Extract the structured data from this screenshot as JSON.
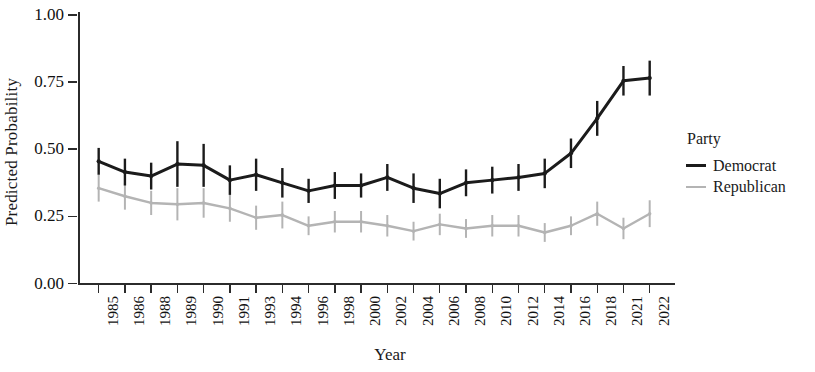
{
  "chart_data": {
    "type": "line",
    "title": "",
    "xlabel": "Year",
    "ylabel": "Predicted Probability",
    "ylim": [
      0.0,
      1.0
    ],
    "yticks": [
      "0.00",
      "0.25",
      "0.50",
      "0.75",
      "1.00"
    ],
    "ytick_values": [
      0.0,
      0.25,
      0.5,
      0.75,
      1.0
    ],
    "grid": false,
    "legend_position": "right",
    "legend_title": "Party",
    "error_bars": "vertical confidence intervals",
    "categories": [
      "1985",
      "1986",
      "1988",
      "1989",
      "1990",
      "1991",
      "1993",
      "1994",
      "1996",
      "1998",
      "2000",
      "2002",
      "2004",
      "2006",
      "2008",
      "2010",
      "2012",
      "2014",
      "2016",
      "2018",
      "2021",
      "2022"
    ],
    "series": [
      {
        "name": "Democrat",
        "color": "#1b1b1b",
        "values": [
          0.455,
          0.415,
          0.4,
          0.445,
          0.44,
          0.385,
          0.405,
          0.375,
          0.345,
          0.365,
          0.365,
          0.395,
          0.355,
          0.335,
          0.375,
          0.385,
          0.395,
          0.41,
          0.485,
          0.615,
          0.755,
          0.765
        ],
        "ci_low": [
          0.405,
          0.365,
          0.35,
          0.36,
          0.36,
          0.33,
          0.345,
          0.32,
          0.3,
          0.315,
          0.32,
          0.345,
          0.3,
          0.28,
          0.325,
          0.335,
          0.345,
          0.355,
          0.43,
          0.55,
          0.7,
          0.7
        ],
        "ci_high": [
          0.505,
          0.465,
          0.45,
          0.53,
          0.52,
          0.44,
          0.465,
          0.43,
          0.39,
          0.415,
          0.41,
          0.445,
          0.41,
          0.39,
          0.425,
          0.435,
          0.445,
          0.465,
          0.54,
          0.68,
          0.81,
          0.83
        ]
      },
      {
        "name": "Republican",
        "color": "#b4b4b4",
        "values": [
          0.355,
          0.325,
          0.3,
          0.295,
          0.3,
          0.28,
          0.245,
          0.255,
          0.215,
          0.23,
          0.23,
          0.215,
          0.195,
          0.22,
          0.205,
          0.215,
          0.215,
          0.19,
          0.215,
          0.26,
          0.205,
          0.26
        ],
        "ci_low": [
          0.305,
          0.275,
          0.255,
          0.235,
          0.245,
          0.23,
          0.2,
          0.205,
          0.18,
          0.19,
          0.19,
          0.175,
          0.16,
          0.18,
          0.17,
          0.175,
          0.175,
          0.155,
          0.18,
          0.215,
          0.165,
          0.21
        ],
        "ci_high": [
          0.405,
          0.375,
          0.345,
          0.355,
          0.355,
          0.33,
          0.29,
          0.305,
          0.25,
          0.27,
          0.27,
          0.255,
          0.23,
          0.26,
          0.24,
          0.255,
          0.255,
          0.225,
          0.25,
          0.305,
          0.245,
          0.31
        ]
      }
    ]
  },
  "legend": {
    "title": "Party",
    "items": [
      {
        "label": "Democrat",
        "color": "#1b1b1b",
        "width": 3.4
      },
      {
        "label": "Republican",
        "color": "#b4b4b4",
        "width": 2.6
      }
    ]
  },
  "axes": {
    "y_title": "Predicted Probability",
    "x_title": "Year"
  }
}
